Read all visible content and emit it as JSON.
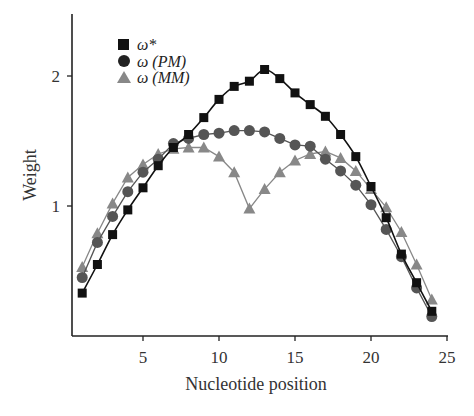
{
  "chart_data": {
    "type": "line",
    "title": "",
    "xlabel": "Nucleotide position",
    "ylabel": "Weight",
    "xlim": [
      0,
      25
    ],
    "ylim": [
      0,
      2.5
    ],
    "x_ticks": [
      5,
      10,
      15,
      20,
      25
    ],
    "y_ticks": [
      1,
      2
    ],
    "grid": false,
    "legend_position": "upper left",
    "x": [
      1,
      2,
      3,
      4,
      5,
      6,
      7,
      8,
      9,
      10,
      11,
      12,
      13,
      14,
      15,
      16,
      17,
      18,
      19,
      20,
      21,
      22,
      23,
      24
    ],
    "series": [
      {
        "name": "ω*",
        "marker": "square",
        "color": "#111111",
        "line": "smooth fit",
        "values": [
          0.33,
          0.55,
          0.78,
          0.97,
          1.14,
          1.31,
          1.45,
          1.55,
          1.68,
          1.82,
          1.92,
          1.96,
          2.05,
          1.98,
          1.87,
          1.78,
          1.69,
          1.55,
          1.38,
          1.15,
          0.91,
          0.63,
          0.41,
          0.19
        ]
      },
      {
        "name": "ω(PM)",
        "marker": "circle",
        "color": "#555555",
        "line": "connected",
        "values": [
          0.45,
          0.72,
          0.92,
          1.11,
          1.26,
          1.36,
          1.48,
          1.52,
          1.55,
          1.56,
          1.58,
          1.58,
          1.57,
          1.52,
          1.47,
          1.46,
          1.36,
          1.27,
          1.16,
          1.01,
          0.82,
          0.61,
          0.37,
          0.15
        ]
      },
      {
        "name": "ω(MM)",
        "marker": "triangle",
        "color": "#888888",
        "line": "connected",
        "values": [
          0.53,
          0.79,
          1.02,
          1.22,
          1.32,
          1.4,
          1.44,
          1.45,
          1.45,
          1.38,
          1.26,
          0.98,
          1.13,
          1.26,
          1.35,
          1.4,
          1.42,
          1.37,
          1.27,
          1.13,
          0.99,
          0.8,
          0.55,
          0.28
        ]
      }
    ]
  },
  "legend": {
    "items": [
      {
        "label": "ω*",
        "marker": "square",
        "color": "#111111"
      },
      {
        "label": "ω (PM)",
        "marker": "circle",
        "color": "#222222"
      },
      {
        "label": "ω (MM)",
        "marker": "triangle",
        "color": "#888888"
      }
    ]
  },
  "axes": {
    "xlabel": "Nucleotide position",
    "ylabel": "Weight",
    "x_tick_labels": [
      "5",
      "10",
      "15",
      "20",
      "25"
    ],
    "y_tick_labels": [
      "1",
      "2"
    ]
  }
}
